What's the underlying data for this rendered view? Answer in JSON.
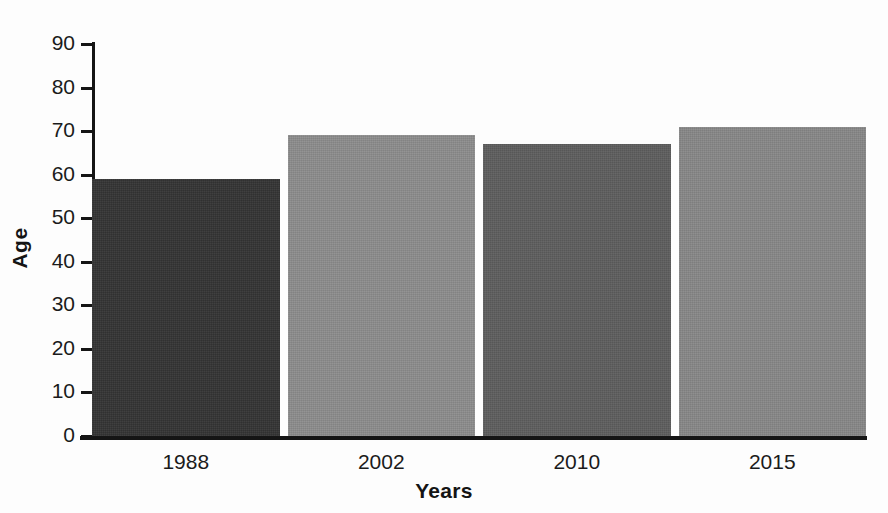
{
  "chart_data": {
    "type": "bar",
    "title": "",
    "subtitle": "",
    "xlabel": "Years",
    "ylabel": "Age",
    "categories": [
      "1988",
      "2002",
      "2010",
      "2015"
    ],
    "values": [
      59,
      69,
      67,
      71
    ],
    "series": [
      {
        "name": "Age",
        "values": [
          59,
          69,
          67,
          71
        ]
      }
    ],
    "ylim": [
      0,
      90
    ],
    "yticks": [
      "0",
      "10",
      "20",
      "30",
      "40",
      "50",
      "60",
      "70",
      "80",
      "90"
    ],
    "ytick_values": [
      0,
      10,
      20,
      30,
      40,
      50,
      60,
      70,
      80,
      90
    ],
    "grid": false,
    "legend": false,
    "legend_position": "none",
    "bar_colors": [
      "#333333",
      "#8c8c8c",
      "#5d5d5d",
      "#878787"
    ],
    "background_color": "#fdfdfd",
    "axis_color": "#151515",
    "text_color": "#1b1b1b",
    "annotations": []
  },
  "axes": {
    "y": {
      "title": "Age",
      "ticks": [
        {
          "label": "90",
          "value": 90
        },
        {
          "label": "80",
          "value": 80
        },
        {
          "label": "70",
          "value": 70
        },
        {
          "label": "60",
          "value": 60
        },
        {
          "label": "50",
          "value": 50
        },
        {
          "label": "40",
          "value": 40
        },
        {
          "label": "30",
          "value": 30
        },
        {
          "label": "20",
          "value": 20
        },
        {
          "label": "10",
          "value": 10
        },
        {
          "label": "0",
          "value": 0
        }
      ]
    },
    "x": {
      "title": "Years",
      "ticks": [
        {
          "label": "1988"
        },
        {
          "label": "2002"
        },
        {
          "label": "2010"
        },
        {
          "label": "2015"
        }
      ]
    }
  },
  "bars": [
    {
      "category": "1988",
      "value": 59,
      "color": "#333333"
    },
    {
      "category": "2002",
      "value": 69,
      "color": "#8c8c8c"
    },
    {
      "category": "2010",
      "value": 67,
      "color": "#5d5d5d"
    },
    {
      "category": "2015",
      "value": 71,
      "color": "#878787"
    }
  ]
}
